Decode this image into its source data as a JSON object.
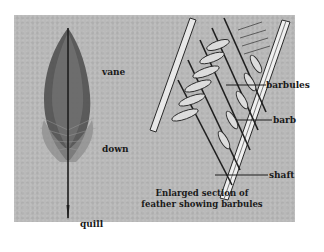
{
  "figure": {
    "feather_labels": {
      "vane": "vane",
      "down": "down",
      "quill": "quill"
    },
    "detail_labels": {
      "barbules": "barbules",
      "barb": "barb",
      "shaft": "shaft"
    },
    "caption_line1": "Enlarged section of",
    "caption_line2": "feather showing barbules"
  },
  "colors": {
    "background": "#ffffff",
    "panel": "#b9b9b9",
    "ink": "#1a1a1a"
  }
}
